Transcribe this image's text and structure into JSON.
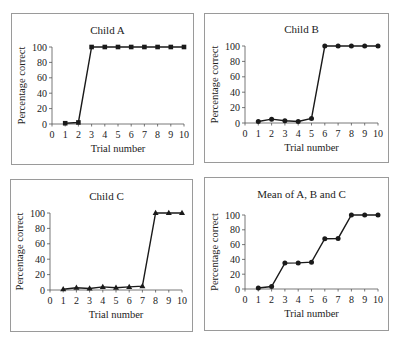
{
  "chart_data": [
    {
      "type": "line",
      "title": "Child A",
      "xlabel": "Trial number",
      "ylabel": "Percentage correct",
      "x": [
        1,
        2,
        3,
        4,
        5,
        6,
        7,
        8,
        9,
        10
      ],
      "series": [
        {
          "name": "Child A",
          "marker": "square",
          "values": [
            1,
            2,
            100,
            100,
            100,
            100,
            100,
            100,
            100,
            100
          ]
        }
      ],
      "xticks": [
        "0",
        "1",
        "2",
        "3",
        "4",
        "5",
        "6",
        "7",
        "8",
        "9",
        "10"
      ],
      "yticks": [
        "0",
        "20",
        "40",
        "60",
        "80",
        "100"
      ],
      "xlim": [
        0,
        10
      ],
      "ylim": [
        0,
        100
      ],
      "grid": false,
      "legend": "none"
    },
    {
      "type": "line",
      "title": "Child B",
      "xlabel": "Trial number",
      "ylabel": "Percentage correct",
      "x": [
        1,
        2,
        3,
        4,
        5,
        6,
        7,
        8,
        9,
        10
      ],
      "series": [
        {
          "name": "Child B",
          "marker": "circle",
          "values": [
            2,
            5,
            3,
            2,
            6,
            100,
            100,
            100,
            100,
            100
          ]
        }
      ],
      "xticks": [
        "0",
        "1",
        "2",
        "3",
        "4",
        "5",
        "6",
        "7",
        "8",
        "9",
        "10"
      ],
      "yticks": [
        "0",
        "20",
        "40",
        "60",
        "80",
        "100"
      ],
      "xlim": [
        0,
        10
      ],
      "ylim": [
        0,
        100
      ],
      "grid": false,
      "legend": "none"
    },
    {
      "type": "line",
      "title": "Child C",
      "xlabel": "Trial number",
      "ylabel": "Percentage correct",
      "x": [
        1,
        2,
        3,
        4,
        5,
        6,
        7,
        8,
        9,
        10
      ],
      "series": [
        {
          "name": "Child C",
          "marker": "triangle",
          "values": [
            1,
            3,
            2,
            4,
            3,
            4,
            5,
            100,
            100,
            100
          ]
        }
      ],
      "xticks": [
        "0",
        "1",
        "2",
        "3",
        "4",
        "5",
        "6",
        "7",
        "8",
        "9",
        "10"
      ],
      "yticks": [
        "0",
        "20",
        "40",
        "60",
        "80",
        "100"
      ],
      "xlim": [
        0,
        10
      ],
      "ylim": [
        0,
        100
      ],
      "grid": false,
      "legend": "none"
    },
    {
      "type": "line",
      "title": "Mean of A, B and C",
      "xlabel": "Trial number",
      "ylabel": "Percentage correct",
      "x": [
        1,
        2,
        3,
        4,
        5,
        6,
        7,
        8,
        9,
        10
      ],
      "series": [
        {
          "name": "Mean",
          "marker": "circle",
          "values": [
            1.3,
            3.3,
            35,
            35.3,
            36.3,
            68,
            68.3,
            100,
            100,
            100
          ]
        }
      ],
      "xticks": [
        "0",
        "1",
        "2",
        "3",
        "4",
        "5",
        "6",
        "7",
        "8",
        "9",
        "10"
      ],
      "yticks": [
        "0",
        "20",
        "40",
        "60",
        "80",
        "100"
      ],
      "xlim": [
        0,
        10
      ],
      "ylim": [
        0,
        100
      ],
      "grid": false,
      "legend": "none"
    }
  ],
  "layout": {
    "panels": [
      {
        "box": [
          11,
          13,
          183,
          152
        ],
        "plot": {
          "x0": 52,
          "x1": 184,
          "y0": 124,
          "y100": 47
        },
        "title_y": 30
      },
      {
        "box": [
          204,
          13,
          185,
          150
        ],
        "plot": {
          "x0": 245,
          "x1": 378,
          "y0": 123,
          "y100": 46
        },
        "title_y": 29
      },
      {
        "box": [
          10,
          179,
          183,
          153
        ],
        "plot": {
          "x0": 50,
          "x1": 182,
          "y0": 290,
          "y100": 213
        },
        "title_y": 196
      },
      {
        "box": [
          204,
          177,
          185,
          154
        ],
        "plot": {
          "x0": 245,
          "x1": 378,
          "y0": 289,
          "y100": 215
        },
        "title_y": 194
      }
    ],
    "line_color": "#1a1a1a",
    "axis_color": "#555555",
    "border_color": "#9a9a9a"
  }
}
